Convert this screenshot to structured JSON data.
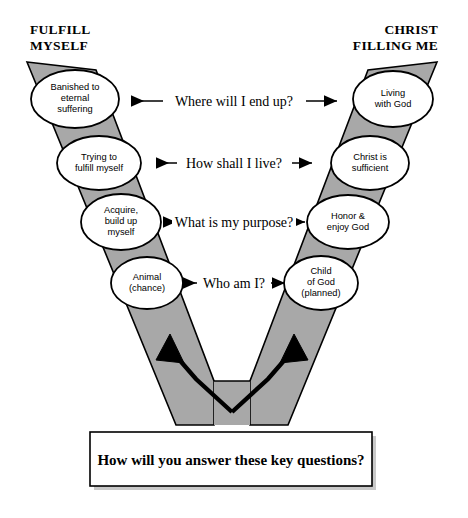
{
  "diagram": {
    "title_left": "FULFILL\nMYSELF",
    "title_left_line1": "FULFILL",
    "title_left_line2": "MYSELF",
    "title_right_line1": "CHRIST",
    "title_right_line2": "FILLING ME",
    "arm_fill_color": "#a8a8a8",
    "arm_stroke_color": "#000000",
    "ellipse_fill_color": "#ffffff",
    "background_color": "#ffffff"
  },
  "questions": [
    {
      "id": "q-end-up",
      "label": "Where will I end up?"
    },
    {
      "id": "q-live",
      "label": "How shall I live?"
    },
    {
      "id": "q-purpose",
      "label": "What is my purpose?"
    },
    {
      "id": "q-who",
      "label": "Who am I?"
    }
  ],
  "left_nodes": [
    {
      "id": "left-1",
      "lines": [
        "Banished to",
        "eternal",
        "suffering"
      ]
    },
    {
      "id": "left-2",
      "lines": [
        "Trying to",
        "fulfill myself"
      ]
    },
    {
      "id": "left-3",
      "lines": [
        "Acquire,",
        "build up",
        "myself"
      ]
    },
    {
      "id": "left-4",
      "lines": [
        "Animal",
        "(chance)"
      ]
    }
  ],
  "right_nodes": [
    {
      "id": "right-1",
      "lines": [
        "Living",
        "with God"
      ]
    },
    {
      "id": "right-2",
      "lines": [
        "Christ is",
        "sufficient"
      ]
    },
    {
      "id": "right-3",
      "lines": [
        "Honor &",
        "enjoy God"
      ]
    },
    {
      "id": "right-4",
      "lines": [
        "Child",
        "of God",
        "(planned)"
      ]
    }
  ],
  "caption_box": {
    "text": "How will you answer these key questions?"
  }
}
